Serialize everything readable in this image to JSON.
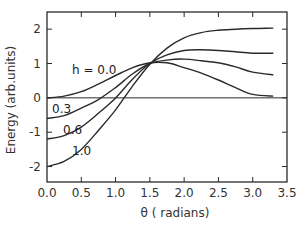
{
  "chart_data": {
    "type": "line",
    "title": "",
    "xlabel": "θ ( radians)",
    "ylabel": "Energy (arb.units)",
    "xlim": [
      0.0,
      3.5
    ],
    "ylim": [
      -2.45,
      2.5
    ],
    "xticks": [
      0.0,
      0.5,
      1.0,
      1.5,
      2.0,
      2.5,
      3.0,
      3.5
    ],
    "xtick_labels": [
      "0.0",
      "0.5",
      "1.0",
      "1.5",
      "2.0",
      "2.5",
      "3.0",
      "3.5"
    ],
    "yticks": [
      -2,
      -1,
      0,
      1,
      2
    ],
    "ytick_labels": [
      "-2",
      "-1",
      "0",
      "1",
      "2"
    ],
    "grid": false,
    "reference_line": {
      "y": 0
    },
    "legend": "inline labels",
    "series": [
      {
        "name": "h = 0.0",
        "label": "h = 0.0",
        "x": [
          0.0,
          0.25,
          0.5,
          0.75,
          1.0,
          1.25,
          1.5,
          1.75,
          2.0,
          2.25,
          2.5,
          2.75,
          3.0,
          3.3
        ],
        "y": [
          0.0,
          0.05,
          0.18,
          0.4,
          0.65,
          0.88,
          1.02,
          1.02,
          0.88,
          0.72,
          0.52,
          0.3,
          0.1,
          0.05
        ]
      },
      {
        "name": "h = 0.3",
        "label": "0.3",
        "x": [
          0.0,
          0.25,
          0.5,
          0.75,
          1.0,
          1.25,
          1.5,
          1.75,
          2.0,
          2.25,
          2.5,
          2.75,
          3.0,
          3.3
        ],
        "y": [
          -0.6,
          -0.52,
          -0.3,
          -0.05,
          0.3,
          0.7,
          1.0,
          1.1,
          1.13,
          1.08,
          1.02,
          0.9,
          0.75,
          0.67
        ]
      },
      {
        "name": "h = 0.6",
        "label": "0.6",
        "x": [
          0.0,
          0.25,
          0.5,
          0.75,
          1.0,
          1.25,
          1.5,
          1.75,
          2.0,
          2.25,
          2.5,
          2.75,
          3.0,
          3.3
        ],
        "y": [
          -1.2,
          -1.1,
          -0.85,
          -0.45,
          0.0,
          0.55,
          1.0,
          1.25,
          1.38,
          1.4,
          1.38,
          1.34,
          1.3,
          1.3
        ]
      },
      {
        "name": "h = 1.0",
        "label": "1.0",
        "x": [
          0.0,
          0.25,
          0.5,
          0.75,
          1.0,
          1.25,
          1.5,
          1.75,
          2.0,
          2.25,
          2.5,
          2.75,
          3.0,
          3.3
        ],
        "y": [
          -2.0,
          -1.85,
          -1.5,
          -0.95,
          -0.35,
          0.35,
          0.98,
          1.45,
          1.75,
          1.9,
          1.97,
          2.0,
          2.02,
          2.03
        ]
      }
    ]
  }
}
